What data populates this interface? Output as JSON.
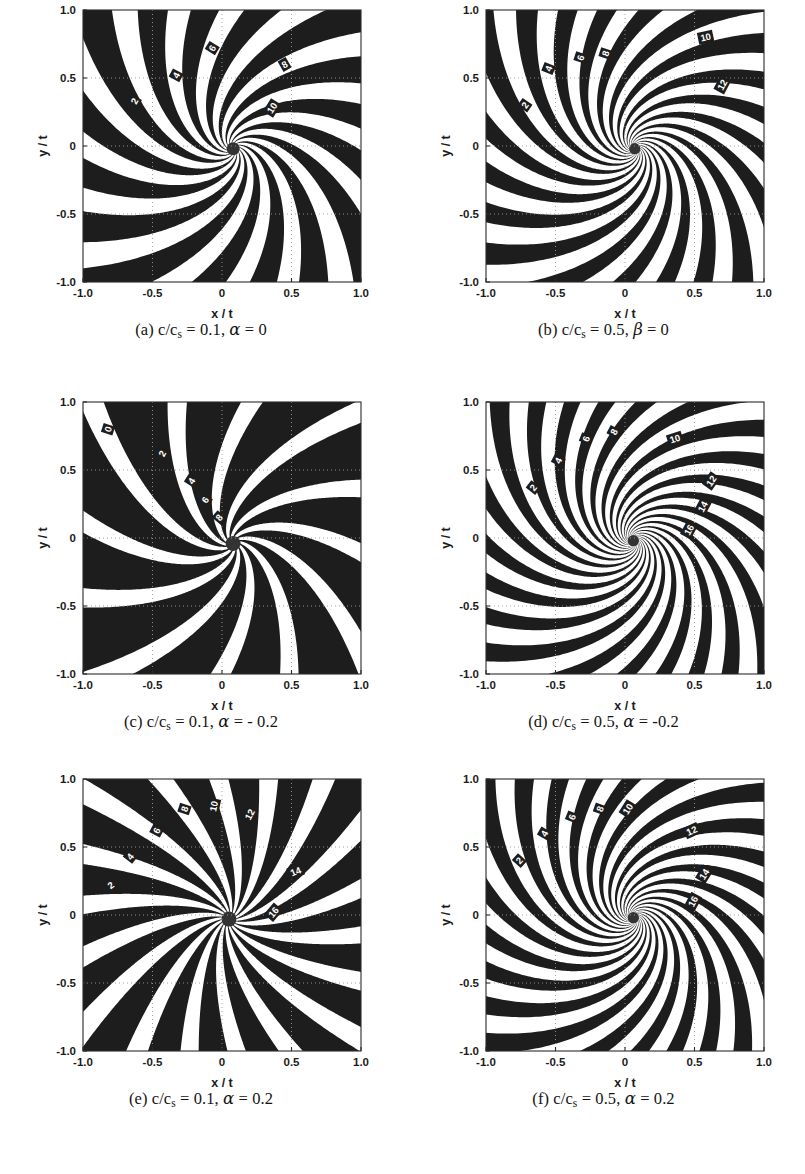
{
  "figure": {
    "kind": "multi-panel-contour-figure",
    "panel_count": 6,
    "columns": 2,
    "rows": 3,
    "background_color": "#ffffff",
    "contour_color": "#1d1d1d",
    "grid_color": "#9a9a9a"
  },
  "axes_common": {
    "xlabel": "x / t",
    "ylabel": "y / t",
    "xlim": [
      -1.0,
      1.0
    ],
    "ylim": [
      -1.0,
      1.0
    ],
    "xticks": [
      "-1.0",
      "-0.5",
      "0",
      "0.5",
      "1.0"
    ],
    "yticks": [
      "1.0",
      "0.5",
      "0",
      "-0.5",
      "-1.0"
    ],
    "xtick_values": [
      -1.0,
      -0.5,
      0,
      0.5,
      1.0
    ],
    "ytick_values": [
      1.0,
      0.5,
      0,
      -0.5,
      -1.0
    ],
    "grid": "dotted",
    "legend": "none"
  },
  "chart_data": [
    {
      "id": "a",
      "type": "contour",
      "title": "(a) c/cs = 0.1, alpha = 0",
      "caption_prefix": "(a)",
      "caption_ratio": "c/c",
      "caption_sub": "s",
      "caption_value": " = 0.1, ",
      "caption_symbol": "α",
      "caption_tail": " = 0",
      "xlabel": "x / t",
      "ylabel": "y / t",
      "xlim": [
        -1.0,
        1.0
      ],
      "ylim": [
        -1.0,
        1.0
      ],
      "params": {
        "c_over_cs": 0.1,
        "alpha": 0
      },
      "contour_levels": [
        2,
        4,
        6,
        8,
        10
      ],
      "labeled_contours": [
        {
          "level": "2",
          "x": -0.63,
          "y": 0.33,
          "rot": -62
        },
        {
          "level": "4",
          "x": -0.33,
          "y": 0.52,
          "rot": -62
        },
        {
          "level": "6",
          "x": -0.07,
          "y": 0.72,
          "rot": -58
        },
        {
          "level": "8",
          "x": 0.45,
          "y": 0.6,
          "rot": -30
        },
        {
          "level": "10",
          "x": 0.36,
          "y": 0.28,
          "rot": -58
        }
      ],
      "spiral": {
        "arms": 16,
        "tightness": 0.56,
        "center_x": 0.08,
        "center_y": -0.02,
        "chirality": "cw",
        "core_radius": 0.035,
        "band_width": 0.3,
        "envelope": 0.55
      }
    },
    {
      "id": "b",
      "type": "contour",
      "title": "(b) c/cs = 0.5, beta = 0",
      "caption_prefix": "(b)",
      "caption_ratio": "c/c",
      "caption_sub": "s",
      "caption_value": " = 0.5, ",
      "caption_symbol": "β",
      "caption_tail": " = 0",
      "xlabel": "x / t",
      "ylabel": "y / t",
      "xlim": [
        -1.0,
        1.0
      ],
      "ylim": [
        -1.0,
        1.0
      ],
      "params": {
        "c_over_cs": 0.5,
        "beta": 0
      },
      "contour_levels": [
        2,
        4,
        6,
        8,
        10,
        12
      ],
      "labeled_contours": [
        {
          "level": "2",
          "x": -0.72,
          "y": 0.3,
          "rot": -55
        },
        {
          "level": "4",
          "x": -0.55,
          "y": 0.57,
          "rot": -68
        },
        {
          "level": "6",
          "x": -0.32,
          "y": 0.65,
          "rot": -72
        },
        {
          "level": "8",
          "x": -0.14,
          "y": 0.68,
          "rot": -72
        },
        {
          "level": "10",
          "x": 0.58,
          "y": 0.8,
          "rot": -12
        },
        {
          "level": "12",
          "x": 0.7,
          "y": 0.45,
          "rot": -62
        }
      ],
      "spiral": {
        "arms": 20,
        "tightness": 0.72,
        "center_x": 0.07,
        "center_y": -0.02,
        "chirality": "cw",
        "core_radius": 0.03,
        "band_width": 0.27,
        "envelope": 0.62
      }
    },
    {
      "id": "c",
      "type": "contour",
      "title": "(c) c/cs = 0.1, alpha = -0.2",
      "caption_prefix": "(c)",
      "caption_ratio": "c/c",
      "caption_sub": "s",
      "caption_value": " = 0.1, ",
      "caption_symbol": "α",
      "caption_tail": " = - 0.2",
      "xlabel": "x / t",
      "ylabel": "y / t",
      "xlim": [
        -1.0,
        1.0
      ],
      "ylim": [
        -1.0,
        1.0
      ],
      "params": {
        "c_over_cs": 0.1,
        "alpha": -0.2
      },
      "contour_levels": [
        0,
        2,
        4,
        6,
        8
      ],
      "labeled_contours": [
        {
          "level": "0",
          "x": -0.82,
          "y": 0.8,
          "rot": -72
        },
        {
          "level": "2",
          "x": -0.43,
          "y": 0.62,
          "rot": -62
        },
        {
          "level": "4",
          "x": -0.22,
          "y": 0.42,
          "rot": -58
        },
        {
          "level": "6",
          "x": -0.12,
          "y": 0.28,
          "rot": -55
        },
        {
          "level": "8",
          "x": -0.02,
          "y": 0.15,
          "rot": -50
        }
      ],
      "spiral": {
        "arms": 12,
        "tightness": 0.4,
        "center_x": 0.08,
        "center_y": -0.04,
        "chirality": "cw",
        "core_radius": 0.04,
        "band_width": 0.4,
        "envelope": 0.4
      }
    },
    {
      "id": "d",
      "type": "contour",
      "title": "(d) c/cs = 0.5, alpha = -0.2",
      "caption_prefix": "(d)",
      "caption_ratio": "c/c",
      "caption_sub": "s",
      "caption_value": " = 0.5, ",
      "caption_symbol": "α",
      "caption_tail": " = -0.2",
      "xlabel": "x / t",
      "ylabel": "y / t",
      "xlim": [
        -1.0,
        1.0
      ],
      "ylim": [
        -1.0,
        1.0
      ],
      "params": {
        "c_over_cs": 0.5,
        "alpha": -0.2
      },
      "contour_levels": [
        2,
        4,
        6,
        8,
        10,
        12,
        14,
        16
      ],
      "labeled_contours": [
        {
          "level": "2",
          "x": -0.66,
          "y": 0.37,
          "rot": -52
        },
        {
          "level": "4",
          "x": -0.48,
          "y": 0.57,
          "rot": -62
        },
        {
          "level": "6",
          "x": -0.28,
          "y": 0.73,
          "rot": -68
        },
        {
          "level": "8",
          "x": -0.08,
          "y": 0.78,
          "rot": -62
        },
        {
          "level": "10",
          "x": 0.36,
          "y": 0.73,
          "rot": -18
        },
        {
          "level": "12",
          "x": 0.62,
          "y": 0.42,
          "rot": -55
        },
        {
          "level": "14",
          "x": 0.56,
          "y": 0.23,
          "rot": -62
        },
        {
          "level": "16",
          "x": 0.46,
          "y": 0.06,
          "rot": -62
        }
      ],
      "spiral": {
        "arms": 22,
        "tightness": 0.82,
        "center_x": 0.06,
        "center_y": -0.02,
        "chirality": "cw",
        "core_radius": 0.03,
        "band_width": 0.26,
        "envelope": 0.66
      }
    },
    {
      "id": "e",
      "type": "contour",
      "title": "(e) c/cs = 0.1, alpha = 0.2",
      "caption_prefix": "(e)",
      "caption_ratio": "c/c",
      "caption_sub": "s",
      "caption_value": " = 0.1, ",
      "caption_symbol": "α",
      "caption_tail": " = 0.2",
      "xlabel": "x / t",
      "ylabel": "y / t",
      "xlim": [
        -1.0,
        1.0
      ],
      "ylim": [
        -1.0,
        1.0
      ],
      "params": {
        "c_over_cs": 0.1,
        "alpha": 0.2
      },
      "contour_levels": [
        2,
        4,
        6,
        8,
        10,
        12,
        14,
        16
      ],
      "labeled_contours": [
        {
          "level": "2",
          "x": -0.8,
          "y": 0.22,
          "rot": -38
        },
        {
          "level": "4",
          "x": -0.66,
          "y": 0.43,
          "rot": -52
        },
        {
          "level": "6",
          "x": -0.47,
          "y": 0.62,
          "rot": -62
        },
        {
          "level": "8",
          "x": -0.27,
          "y": 0.78,
          "rot": -72
        },
        {
          "level": "10",
          "x": -0.06,
          "y": 0.8,
          "rot": -78
        },
        {
          "level": "12",
          "x": 0.2,
          "y": 0.74,
          "rot": -62
        },
        {
          "level": "14",
          "x": 0.53,
          "y": 0.32,
          "rot": -22
        },
        {
          "level": "16",
          "x": 0.37,
          "y": 0.02,
          "rot": -50
        }
      ],
      "spiral": {
        "arms": 18,
        "tightness": 0.22,
        "center_x": 0.05,
        "center_y": -0.03,
        "chirality": "ccw",
        "core_radius": 0.04,
        "band_width": 0.34,
        "envelope": 0.3
      }
    },
    {
      "id": "f",
      "type": "contour",
      "title": "(f) c/cs = 0.5, alpha = 0.2",
      "caption_prefix": "(f)",
      "caption_ratio": "c/c",
      "caption_sub": "s",
      "caption_value": " = 0.5, ",
      "caption_symbol": "α",
      "caption_tail": " = 0.2",
      "xlabel": "x / t",
      "ylabel": "y / t",
      "xlim": [
        -1.0,
        1.0
      ],
      "ylim": [
        -1.0,
        1.0
      ],
      "params": {
        "c_over_cs": 0.5,
        "alpha": 0.2
      },
      "contour_levels": [
        2,
        4,
        6,
        8,
        10,
        12,
        14,
        16
      ],
      "labeled_contours": [
        {
          "level": "2",
          "x": -0.76,
          "y": 0.4,
          "rot": -48
        },
        {
          "level": "4",
          "x": -0.58,
          "y": 0.6,
          "rot": -60
        },
        {
          "level": "6",
          "x": -0.38,
          "y": 0.72,
          "rot": -68
        },
        {
          "level": "8",
          "x": -0.18,
          "y": 0.78,
          "rot": -70
        },
        {
          "level": "10",
          "x": 0.02,
          "y": 0.78,
          "rot": -58
        },
        {
          "level": "12",
          "x": 0.48,
          "y": 0.62,
          "rot": -25
        },
        {
          "level": "14",
          "x": 0.57,
          "y": 0.3,
          "rot": -58
        },
        {
          "level": "16",
          "x": 0.49,
          "y": 0.1,
          "rot": -62
        }
      ],
      "spiral": {
        "arms": 22,
        "tightness": 0.8,
        "center_x": 0.06,
        "center_y": -0.02,
        "chirality": "cw",
        "core_radius": 0.03,
        "band_width": 0.27,
        "envelope": 0.64
      }
    }
  ]
}
